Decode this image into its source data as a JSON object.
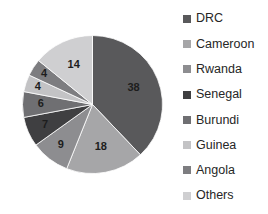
{
  "chart_data": {
    "type": "pie",
    "title": "",
    "subtitle": "",
    "xlabel": "",
    "ylabel": "",
    "grid": false,
    "legend_position": "right",
    "start_angle_deg": 0,
    "direction": "clockwise",
    "units": "percent",
    "total": 100,
    "categories": [
      "DRC",
      "Cameroon",
      "Rwanda",
      "Senegal",
      "Burundi",
      "Guinea",
      "Angola",
      "Others"
    ],
    "values": [
      38,
      18,
      9,
      7,
      6,
      4,
      4,
      14
    ],
    "data_labels": [
      "38",
      "18",
      "9",
      "7",
      "6",
      "4",
      "4",
      "14"
    ],
    "colors": [
      "#59595b",
      "#a6a6a8",
      "#8d8d90",
      "#3f3f41",
      "#6f6f72",
      "#c3c3c5",
      "#7d7d80",
      "#cfcfd1"
    ],
    "slices": [
      {
        "label": "DRC",
        "value": 38,
        "data_label": "38",
        "color": "#59595b"
      },
      {
        "label": "Cameroon",
        "value": 18,
        "data_label": "18",
        "color": "#a6a6a8"
      },
      {
        "label": "Rwanda",
        "value": 9,
        "data_label": "9",
        "color": "#8d8d90"
      },
      {
        "label": "Senegal",
        "value": 7,
        "data_label": "7",
        "color": "#3f3f41"
      },
      {
        "label": "Burundi",
        "value": 6,
        "data_label": "6",
        "color": "#6f6f72"
      },
      {
        "label": "Guinea",
        "value": 4,
        "data_label": "4",
        "color": "#c3c3c5"
      },
      {
        "label": "Angola",
        "value": 4,
        "data_label": "4",
        "color": "#7d7d80"
      },
      {
        "label": "Others",
        "value": 14,
        "data_label": "14",
        "color": "#cfcfd1"
      }
    ]
  },
  "legend": {
    "items": [
      {
        "label": "DRC",
        "color": "#59595b"
      },
      {
        "label": "Cameroon",
        "color": "#a6a6a8"
      },
      {
        "label": "Rwanda",
        "color": "#8d8d90"
      },
      {
        "label": "Senegal",
        "color": "#3f3f41"
      },
      {
        "label": "Burundi",
        "color": "#6f6f72"
      },
      {
        "label": "Guinea",
        "color": "#c3c3c5"
      },
      {
        "label": "Angola",
        "color": "#7d7d80"
      },
      {
        "label": "Others",
        "color": "#cfcfd1"
      }
    ]
  }
}
